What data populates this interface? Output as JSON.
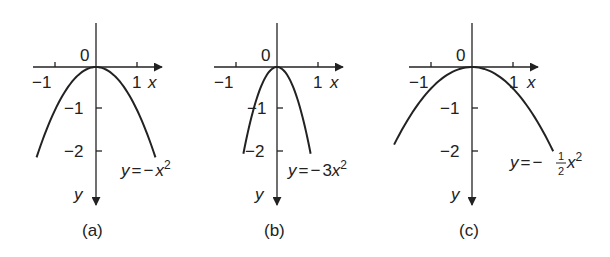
{
  "figure": {
    "panels": [
      {
        "id": "a",
        "caption": "(a)",
        "equation": "y = −x²",
        "eq_parts": {
          "y": "y",
          "eq": "=",
          "minus": "−",
          "coef_num": "",
          "coef_den": "",
          "coef": "",
          "x": "x",
          "exp": "2"
        },
        "coefficient": -1,
        "x_domain": [
          -1.45,
          1.45
        ],
        "origin_px": [
          96,
          67
        ],
        "unit_px": [
          41,
          43
        ],
        "x_axis": {
          "label": "x",
          "ticks": [
            "−1",
            "1"
          ],
          "origin_label": "0"
        },
        "y_axis": {
          "label": "y",
          "ticks": [
            "−1",
            "−2"
          ]
        }
      },
      {
        "id": "b",
        "caption": "(b)",
        "equation": "y = −3x²",
        "eq_parts": {
          "y": "y",
          "eq": "=",
          "minus": "−",
          "coef": "3",
          "x": "x",
          "exp": "2"
        },
        "coefficient": -3,
        "x_domain": [
          -0.82,
          0.82
        ],
        "origin_px": [
          277,
          67
        ],
        "unit_px": [
          41,
          43
        ],
        "x_axis": {
          "label": "x",
          "ticks": [
            "−1",
            "1"
          ],
          "origin_label": "0"
        },
        "y_axis": {
          "label": "y",
          "ticks": [
            "−1",
            "−2"
          ]
        }
      },
      {
        "id": "c",
        "caption": "(c)",
        "equation": "y = −½x²",
        "eq_parts": {
          "y": "y",
          "eq": "=",
          "minus": "−",
          "coef_num": "1",
          "coef_den": "2",
          "x": "x",
          "exp": "2"
        },
        "coefficient": -0.5,
        "x_domain": [
          -1.9,
          1.98
        ],
        "origin_px": [
          472,
          67
        ],
        "unit_px": [
          41,
          43
        ],
        "x_axis": {
          "label": "x",
          "ticks": [
            "−1",
            "1"
          ],
          "origin_label": "0"
        },
        "y_axis": {
          "label": "y",
          "ticks": [
            "−1",
            "−2"
          ]
        }
      }
    ]
  }
}
